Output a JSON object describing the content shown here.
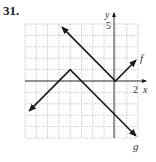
{
  "problem_number": "31.",
  "chart_data": {
    "type": "line",
    "title": "",
    "xlabel": "x",
    "ylabel": "y",
    "xlim": [
      -8,
      2
    ],
    "ylim": [
      -5,
      5
    ],
    "grid": true,
    "tick_labels": {
      "x": [
        "2"
      ],
      "y": [
        "5"
      ]
    },
    "series": [
      {
        "name": "f",
        "equation": "f(x) = |x|",
        "vertex": [
          0,
          0
        ],
        "points": [
          [
            -4.7,
            4.7
          ],
          [
            0,
            0
          ],
          [
            1.8,
            1.8
          ]
        ]
      },
      {
        "name": "g",
        "equation": "g(x) = -|x + 4| + 1",
        "vertex": [
          -4,
          1
        ],
        "points": [
          [
            -7.6,
            -2.6
          ],
          [
            -4,
            1
          ],
          [
            1.8,
            -4.8
          ]
        ]
      }
    ]
  },
  "labels": {
    "x_axis": "x",
    "y_axis": "y",
    "x_tick": "2",
    "y_tick": "5",
    "f": "f",
    "g": "g"
  }
}
